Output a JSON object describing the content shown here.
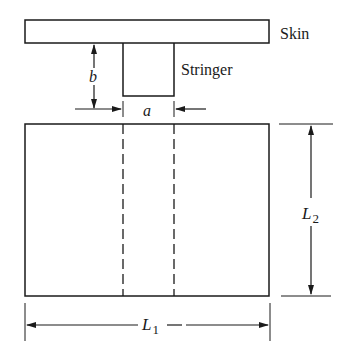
{
  "diagram": {
    "labels": {
      "skin": "Skin",
      "stringer": "Stringer",
      "stringer_width": "a",
      "stringer_height": "b",
      "length_1": "L",
      "length_1_sub": "1",
      "length_2": "L",
      "length_2_sub": "2"
    },
    "colors": {
      "line": "#1a1a1a",
      "background": "#ffffff"
    }
  }
}
